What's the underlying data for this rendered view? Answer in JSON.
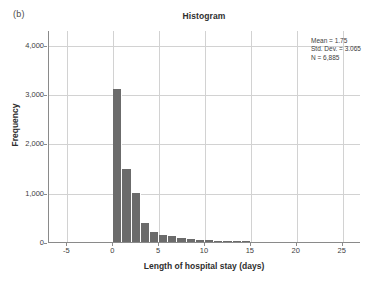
{
  "figure": {
    "panel_label": "(b)",
    "title": "Histogram"
  },
  "stats": {
    "mean": "Mean = 1.75",
    "std_dev": "Std. Dev. = 3.065",
    "n": "N = 6,885"
  },
  "axes": {
    "x_title": "Length of hospital stay (days)",
    "y_title": "Frequency",
    "x_ticks": [
      "-5",
      "0",
      "5",
      "10",
      "15",
      "20",
      "25"
    ],
    "y_ticks": [
      "4,000",
      "3,000",
      "2,000",
      "1,000",
      "0"
    ]
  },
  "colors": {
    "bar": "#6b6b6b",
    "grid": "#d2d2d2",
    "axis": "#8a8a8a",
    "text": "#3d3d3d",
    "background": "#ffffff"
  },
  "chart_data": {
    "type": "bar",
    "title": "Histogram",
    "subtitle": "(b)",
    "xlabel": "Length of hospital stay (days)",
    "ylabel": "Frequency",
    "xlim": [
      -7,
      27
    ],
    "ylim": [
      0,
      4300
    ],
    "grid": true,
    "legend": null,
    "bin_width": 1,
    "x": [
      0,
      1,
      2,
      3,
      4,
      5,
      6,
      7,
      8,
      9,
      10,
      11,
      12,
      13,
      14
    ],
    "values": [
      3100,
      1480,
      990,
      390,
      200,
      150,
      120,
      90,
      55,
      50,
      40,
      22,
      18,
      14,
      20
    ],
    "categories": [
      "0",
      "1",
      "2",
      "3",
      "4",
      "5",
      "6",
      "7",
      "8",
      "9",
      "10",
      "11",
      "12",
      "13",
      "14"
    ],
    "annotations": [
      "Mean = 1.75",
      "Std. Dev. = 3.065",
      "N = 6,885"
    ],
    "x_ticks": [
      -5,
      0,
      5,
      10,
      15,
      20,
      25
    ],
    "y_ticks": [
      0,
      1000,
      2000,
      3000,
      4000
    ]
  }
}
